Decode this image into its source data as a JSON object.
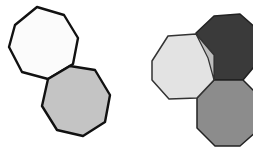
{
  "diagram": {
    "left_group": {
      "shapes": [
        {
          "name": "white-octagon",
          "fill": "#fbfbfb",
          "stroke": "#111111",
          "points": "15,25 37,7 64,15 78,38 73,64 48,79 22,72 9,47"
        },
        {
          "name": "gray-octagon",
          "fill": "#c4c4c4",
          "stroke": "#111111",
          "points": "48,79 70,66 95,70 110,95 105,122 83,136 57,130 42,106"
        }
      ]
    },
    "right_group": {
      "shapes": [
        {
          "name": "dark-octagon",
          "fill": "#3a3a3a",
          "stroke": "#222222",
          "points": "196,33 214,16 240,14 258,30 258,62 243,80 214,80 208,58"
        },
        {
          "name": "medium-gray-octagon",
          "fill": "#8c8c8c",
          "stroke": "#222222",
          "points": "214,80 243,80 258,95 258,130 240,146 215,146 197,128 197,98"
        },
        {
          "name": "light-gray-octagon",
          "fill": "#e3e3e3",
          "stroke": "#333333",
          "points": "152,61 168,36 196,34 214,55 214,80 197,98 169,99 152,80"
        },
        {
          "name": "overlap-region",
          "fill": "#bdbdbd",
          "stroke": "#333333",
          "points": "196,34 214,55 214,80 208,58"
        }
      ]
    }
  }
}
